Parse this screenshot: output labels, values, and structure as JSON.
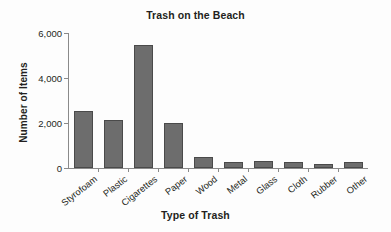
{
  "chart_data": {
    "type": "bar",
    "title": "Trash on the Beach",
    "xlabel": "Type of Trash",
    "ylabel": "Number of Items",
    "categories": [
      "Styrofoam",
      "Plastic",
      "Cigarettes",
      "Paper",
      "Wood",
      "Metal",
      "Glass",
      "Cloth",
      "Rubber",
      "Other"
    ],
    "values": [
      2550,
      2150,
      5450,
      2000,
      500,
      250,
      300,
      250,
      200,
      260
    ],
    "ylim": [
      0,
      6000
    ],
    "ytick_labels": [
      "0",
      "2,000",
      "4,000",
      "6,000"
    ],
    "ytick_values": [
      0,
      2000,
      4000,
      6000
    ],
    "grid": false,
    "legend": false,
    "bar_color": "#6d6d6d",
    "bar_edge_color": "#4a4a4a",
    "axis_color": "#8a8a8a",
    "background_color": "#fdfdfd",
    "text_color": "#231f20"
  }
}
